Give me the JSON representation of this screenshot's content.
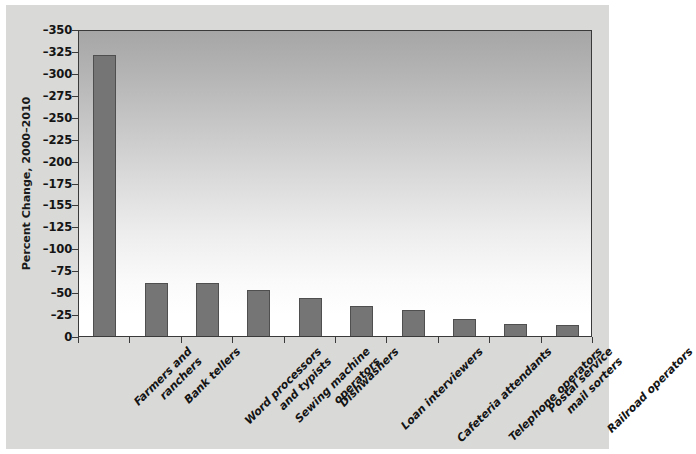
{
  "figure": {
    "background_color": "#d9dad8",
    "plot_border_color": "#3a3a3a",
    "bar_color": "#757575",
    "bar_edge_color": "#4f4f4f"
  },
  "chart_data": {
    "type": "bar",
    "title": "",
    "xlabel": "",
    "ylabel": "Percent Change, 2000–2010",
    "orientation": "vertical",
    "y_axis_inverted": true,
    "ylim": [
      0,
      -350
    ],
    "grid": false,
    "legend": null,
    "categories": [
      "Farmers and\nranchers",
      "Bank tellers",
      "Word processors\nand typists",
      "Sewing machine\noperators",
      "Dishwashers",
      "Loan interviewers",
      "Cafeteria attendants",
      "Telephone operators",
      "Postal service\nmail sorters",
      "Railroad operators"
    ],
    "values": [
      -320,
      -61,
      -61,
      -52,
      -43,
      -34,
      -30,
      -19,
      -14,
      -13
    ],
    "ytick_labels": [
      "0",
      "–25",
      "–50",
      "–75",
      "–100",
      "–125",
      "–155",
      "–175",
      "–200",
      "–225",
      "–250",
      "–275",
      "–300",
      "–325",
      "–350"
    ],
    "ytick_values": [
      0,
      -25,
      -50,
      -75,
      -100,
      -125,
      -150,
      -175,
      -200,
      -225,
      -250,
      -275,
      -300,
      -325,
      -350
    ]
  }
}
